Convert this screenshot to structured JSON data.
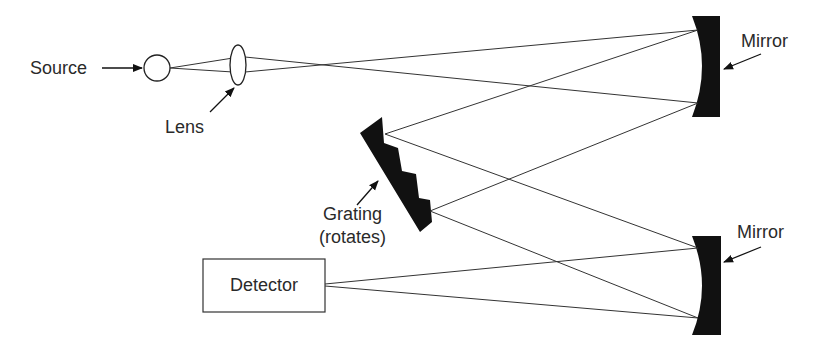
{
  "diagram": {
    "labels": {
      "source": "Source",
      "lens": "Lens",
      "mirror_top": "Mirror",
      "mirror_bottom": "Mirror",
      "grating_line1": "Grating",
      "grating_line2": "(rotates)",
      "detector": "Detector"
    },
    "colors": {
      "ink": "#111111",
      "text": "#2a2a2a",
      "background": "#ffffff"
    }
  }
}
